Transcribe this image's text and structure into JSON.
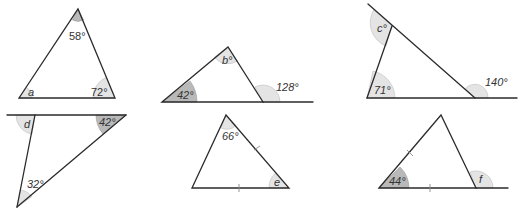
{
  "figure": {
    "triangles": [
      {
        "id": 1,
        "angles": [
          {
            "label": "58°",
            "position": "apex"
          },
          {
            "label": "a",
            "position": "bottom-left"
          },
          {
            "label": "72°",
            "position": "bottom-right"
          }
        ]
      },
      {
        "id": 2,
        "angles": [
          {
            "label": "b°",
            "position": "apex"
          },
          {
            "label": "42°",
            "position": "bottom-left"
          },
          {
            "label": "128°",
            "position": "exterior-right"
          }
        ]
      },
      {
        "id": 3,
        "angles": [
          {
            "label": "c°",
            "position": "top-exterior"
          },
          {
            "label": "71°",
            "position": "bottom-left"
          },
          {
            "label": "140°",
            "position": "exterior-right"
          }
        ]
      },
      {
        "id": 4,
        "angles": [
          {
            "label": "d",
            "position": "top-left-exterior"
          },
          {
            "label": "42°",
            "position": "top-right"
          },
          {
            "label": "32°",
            "position": "bottom"
          }
        ]
      },
      {
        "id": 5,
        "angles": [
          {
            "label": "66°",
            "position": "apex"
          },
          {
            "label": "e",
            "position": "bottom-right"
          }
        ],
        "equal_sides": true
      },
      {
        "id": 6,
        "angles": [
          {
            "label": "44°",
            "position": "bottom-left"
          },
          {
            "label": "f",
            "position": "exterior-right"
          }
        ],
        "equal_sides": true
      }
    ]
  },
  "labels": {
    "t1_top": "58°",
    "t1_a": "a",
    "t1_right": "72°",
    "t2_top": "b°",
    "t2_left": "42°",
    "t2_ext": "128°",
    "t3_c": "c°",
    "t3_left": "71°",
    "t3_ext": "140°",
    "t4_d": "d",
    "t4_right": "42°",
    "t4_bottom": "32°",
    "t5_top": "66°",
    "t5_e": "e",
    "t6_left": "44°",
    "t6_f": "f"
  }
}
